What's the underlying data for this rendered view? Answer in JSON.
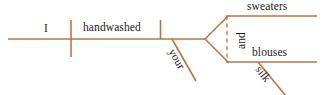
{
  "diagram": {
    "type": "reed-kellogg-sentence-diagram",
    "sentence": "I handwashed your sweaters and blouses silk",
    "stroke_color": "#b8763f",
    "text_color": "#1b1b1b",
    "background_color": "#ffffff",
    "words": {
      "subject": "I",
      "verb": "handwashed",
      "modifier_your": "your",
      "object_one": "sweaters",
      "conjunction": "and",
      "object_two": "blouses",
      "modifier_silk": "silk"
    },
    "lines": {
      "baseline": {
        "x1": 8,
        "y1": 39,
        "x2": 205,
        "y2": 39
      },
      "subject_verb_divider": {
        "x1": 71,
        "y1": 20,
        "x2": 71,
        "y2": 57
      },
      "verb_object_divider": {
        "x1": 160,
        "y1": 20,
        "x2": 160,
        "y2": 39
      },
      "your_slant": {
        "x1": 172,
        "y1": 39,
        "x2": 196,
        "y2": 81
      },
      "fork_upper": {
        "x1": 205,
        "y1": 39,
        "x2": 228,
        "y2": 16
      },
      "fork_lower": {
        "x1": 205,
        "y1": 39,
        "x2": 228,
        "y2": 62
      },
      "branch_upper": {
        "x1": 227,
        "y1": 16,
        "x2": 316,
        "y2": 16
      },
      "branch_lower": {
        "x1": 227,
        "y1": 62,
        "x2": 316,
        "y2": 62
      },
      "conjunction_dashed": {
        "x1": 227,
        "y1": 17,
        "x2": 227,
        "y2": 61
      },
      "silk_slant": {
        "x1": 258,
        "y1": 62,
        "x2": 285,
        "y2": 95
      }
    }
  }
}
